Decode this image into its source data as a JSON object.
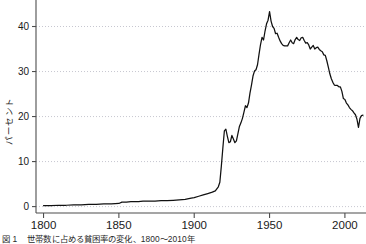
{
  "figure": {
    "ylabel": "パーセント",
    "caption_lead": "図 1",
    "caption_text": "世帯数に占める貧困率の変化、1800〜2010年",
    "axis_color": "#4d4d4d",
    "line_color": "#111111",
    "grid_color": "#b9b9c4",
    "background": "#ffffff"
  },
  "chart_data": {
    "type": "line",
    "title": "",
    "xlabel": "",
    "ylabel": "パーセント",
    "xlim": [
      1795,
      2014
    ],
    "ylim": [
      -1.2,
      45
    ],
    "xticks": [
      1800,
      1850,
      1900,
      1950,
      2000
    ],
    "yticks": [
      0,
      10,
      20,
      30,
      40
    ],
    "grid": "horizontal-dotted",
    "legend": "none",
    "series": [
      {
        "name": "パーセント",
        "x": [
          1800,
          1805,
          1810,
          1815,
          1820,
          1825,
          1830,
          1835,
          1840,
          1845,
          1850,
          1852,
          1855,
          1858,
          1860,
          1863,
          1866,
          1870,
          1874,
          1878,
          1882,
          1886,
          1890,
          1894,
          1898,
          1900,
          1903,
          1906,
          1909,
          1912,
          1914,
          1916,
          1917,
          1918,
          1919,
          1920,
          1921,
          1922,
          1923,
          1924,
          1925,
          1926,
          1927,
          1928,
          1929,
          1930,
          1931,
          1932,
          1933,
          1934,
          1935,
          1936,
          1937,
          1938,
          1939,
          1940,
          1941,
          1942,
          1943,
          1944,
          1945,
          1946,
          1947,
          1948,
          1949,
          1950,
          1951,
          1952,
          1953,
          1954,
          1955,
          1956,
          1957,
          1958,
          1959,
          1960,
          1961,
          1962,
          1963,
          1964,
          1965,
          1966,
          1967,
          1968,
          1969,
          1970,
          1971,
          1972,
          1973,
          1974,
          1975,
          1976,
          1977,
          1978,
          1979,
          1980,
          1981,
          1982,
          1983,
          1984,
          1985,
          1986,
          1987,
          1988,
          1989,
          1990,
          1991,
          1992,
          1993,
          1994,
          1995,
          1996,
          1997,
          1998,
          1999,
          2000,
          2001,
          2002,
          2003,
          2004,
          2005,
          2006,
          2007,
          2008,
          2009,
          2010,
          2011,
          2012
        ],
        "y": [
          0.2,
          0.2,
          0.3,
          0.3,
          0.4,
          0.4,
          0.5,
          0.5,
          0.6,
          0.6,
          0.7,
          1.0,
          1.0,
          1.1,
          1.1,
          1.1,
          1.2,
          1.2,
          1.2,
          1.3,
          1.3,
          1.4,
          1.5,
          1.6,
          1.9,
          2.0,
          2.3,
          2.6,
          2.9,
          3.2,
          3.5,
          4.4,
          5.4,
          9.0,
          13.0,
          16.8,
          17.2,
          15.6,
          14.2,
          14.4,
          15.8,
          15.0,
          14.2,
          14.6,
          16.2,
          17.8,
          18.6,
          19.6,
          21.0,
          22.4,
          22.0,
          23.0,
          25.2,
          27.0,
          29.0,
          30.1,
          30.4,
          31.5,
          33.8,
          36.0,
          37.6,
          37.0,
          39.0,
          40.6,
          41.4,
          43.3,
          41.2,
          40.0,
          39.6,
          38.4,
          38.5,
          37.6,
          36.8,
          36.2,
          35.8,
          35.7,
          35.7,
          35.7,
          36.4,
          37.0,
          36.4,
          36.2,
          37.1,
          37.6,
          37.1,
          36.9,
          37.5,
          37.6,
          36.9,
          36.3,
          36.4,
          35.9,
          35.0,
          35.4,
          35.8,
          35.0,
          35.3,
          35.4,
          34.9,
          34.6,
          34.4,
          33.7,
          33.6,
          32.4,
          31.0,
          29.5,
          28.4,
          27.6,
          27.0,
          26.9,
          26.9,
          26.6,
          26.6,
          25.6,
          24.0,
          23.8,
          23.0,
          22.6,
          22.0,
          21.6,
          21.3,
          20.8,
          20.4,
          19.4,
          17.6,
          19.6,
          20.2,
          20.3
        ]
      }
    ]
  },
  "axis_ticks": {
    "x_labels": [
      "1800",
      "1850",
      "1900",
      "1950",
      "2000"
    ],
    "y_labels": [
      "0",
      "10",
      "20",
      "30",
      "40"
    ]
  }
}
